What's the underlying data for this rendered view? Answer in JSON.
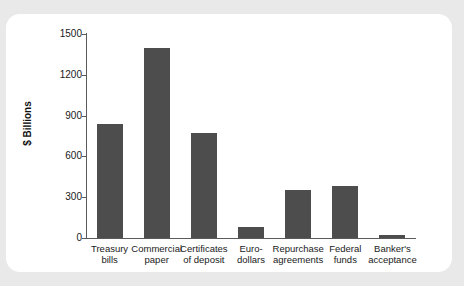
{
  "chart_data": {
    "type": "bar",
    "title": "",
    "xlabel": "",
    "ylabel": "$ Billions",
    "ylim": [
      0,
      1500
    ],
    "yticks": [
      0,
      300,
      600,
      900,
      1200,
      1500
    ],
    "ytick_labels": [
      "0",
      "300",
      "600",
      "900",
      "1200",
      "1500"
    ],
    "grid": false,
    "legend": null,
    "bar_color": "#4d4d4d",
    "categories": [
      "Treasury\nbills",
      "Commercial\npaper",
      "Certificates\nof deposit",
      "Euro-\ndollars",
      "Repurchase\nagreements",
      "Federal\nfunds",
      "Banker's\nacceptance"
    ],
    "values": [
      838,
      1397,
      772,
      81,
      353,
      382,
      22
    ]
  },
  "figure": {
    "background_color": "#e9e9e9",
    "card_color": "#ffffff"
  }
}
